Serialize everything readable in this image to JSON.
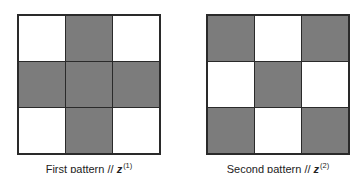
{
  "patterns": [
    {
      "caption_text": "First pattern // ",
      "variable": "z",
      "superscript": "(1)",
      "cells": [
        [
          0,
          1,
          0
        ],
        [
          1,
          1,
          1
        ],
        [
          0,
          1,
          0
        ]
      ]
    },
    {
      "caption_text": "Second pattern // ",
      "variable": "z",
      "superscript": "(2)",
      "cells": [
        [
          1,
          0,
          1
        ],
        [
          0,
          1,
          0
        ],
        [
          1,
          0,
          1
        ]
      ]
    }
  ],
  "colors": {
    "filled": "#7c7c7c",
    "empty": "#ffffff",
    "border": "#2a2a2a"
  }
}
